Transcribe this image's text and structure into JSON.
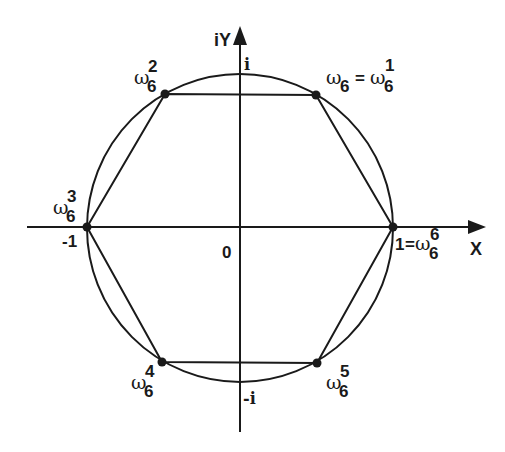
{
  "diagram": {
    "axes": {
      "x_label": "X",
      "y_label": "iY",
      "origin_label": "0",
      "x_pos_label": "1",
      "x_neg_label": "-1",
      "y_pos_label": "i",
      "y_neg_label": "-i"
    },
    "vertices": [
      {
        "id": "w1",
        "base": "ω",
        "sub": "6",
        "sup": "1",
        "prefix": "ω",
        "prefix_sub": "6",
        "eq": "="
      },
      {
        "id": "w2",
        "base": "ω",
        "sub": "6",
        "sup": "2"
      },
      {
        "id": "w3",
        "base": "ω",
        "sub": "6",
        "sup": "3"
      },
      {
        "id": "w4",
        "base": "ω",
        "sub": "6",
        "sup": "4"
      },
      {
        "id": "w5",
        "base": "ω",
        "sub": "6",
        "sup": "5"
      },
      {
        "id": "w6",
        "base": "ω",
        "sub": "6",
        "sup": "6",
        "prefix": "1",
        "eq": "="
      }
    ],
    "colors": {
      "stroke": "#1a1a1a",
      "background": "#ffffff"
    }
  }
}
